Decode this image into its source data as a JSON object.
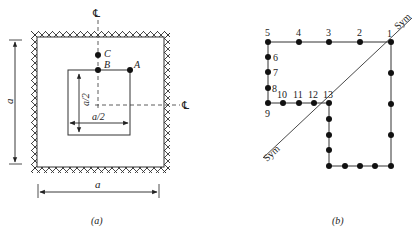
{
  "figure_a": {
    "caption": "(a)",
    "centerline_top": "℄",
    "centerline_right": "℄",
    "points": [
      {
        "label": "C",
        "x": 98,
        "y": 55
      },
      {
        "label": "B",
        "x": 98,
        "y": 70
      },
      {
        "label": "A",
        "x": 130,
        "y": 70
      }
    ],
    "dim_outer_vertical": "a",
    "dim_outer_horizontal": "a",
    "dim_inner_vertical": "a/2",
    "dim_inner_horizontal": "a/2"
  },
  "figure_b": {
    "caption": "(b)",
    "sym_top": "Sym",
    "sym_bottom": "Sym",
    "nodes": [
      {
        "label": "1",
        "x": 391,
        "y": 42
      },
      {
        "label": "2",
        "x": 360,
        "y": 42
      },
      {
        "label": "3",
        "x": 329,
        "y": 42
      },
      {
        "label": "4",
        "x": 299,
        "y": 42
      },
      {
        "label": "5",
        "x": 268,
        "y": 42
      },
      {
        "label": "6",
        "x": 268,
        "y": 57
      },
      {
        "label": "7",
        "x": 268,
        "y": 72
      },
      {
        "label": "8",
        "x": 268,
        "y": 88
      },
      {
        "label": "9",
        "x": 268,
        "y": 103
      },
      {
        "label": "10",
        "x": 283,
        "y": 103
      },
      {
        "label": "11",
        "x": 299,
        "y": 103
      },
      {
        "label": "12",
        "x": 314,
        "y": 103
      },
      {
        "label": "13",
        "x": 329,
        "y": 103
      }
    ],
    "unlabeled_nodes": [
      {
        "x": 391,
        "y": 73
      },
      {
        "x": 391,
        "y": 104
      },
      {
        "x": 391,
        "y": 135
      },
      {
        "x": 391,
        "y": 166
      },
      {
        "x": 329,
        "y": 119
      },
      {
        "x": 329,
        "y": 135
      },
      {
        "x": 329,
        "y": 150
      },
      {
        "x": 329,
        "y": 166
      },
      {
        "x": 345,
        "y": 166
      },
      {
        "x": 360,
        "y": 166
      },
      {
        "x": 375,
        "y": 166
      }
    ]
  }
}
